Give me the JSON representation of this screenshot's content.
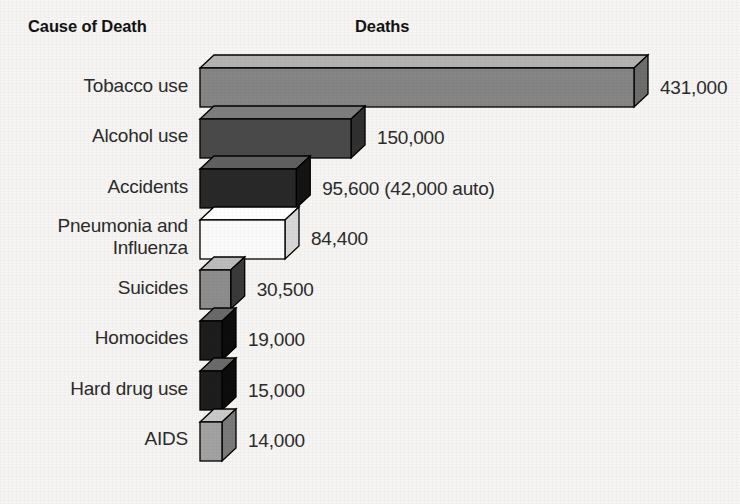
{
  "header": {
    "cause_label": "Cause of Death",
    "deaths_label": "Deaths"
  },
  "chart_data": {
    "type": "bar",
    "title": "Deaths",
    "xlabel": "Deaths",
    "ylabel": "Cause of Death",
    "orientation": "horizontal",
    "style": "3d-extruded-bars",
    "grid": false,
    "legend": false,
    "xlim": [
      0,
      431000
    ],
    "categories": [
      "Tobacco use",
      "Alcohol use",
      "Accidents",
      "Pneumonia and Influenza",
      "Suicides",
      "Homocides",
      "Hard drug use",
      "AIDS"
    ],
    "values": [
      431000,
      150000,
      95600,
      84400,
      30500,
      19000,
      15000,
      14000
    ],
    "value_labels": [
      "431,000",
      "150,000",
      "95,600 (42,000 auto)",
      "84,400",
      "30,500",
      "19,000",
      "15,000",
      "14,000"
    ],
    "annotations": [
      {
        "category": "Accidents",
        "text": "42,000 auto",
        "value": 42000
      }
    ],
    "bars": [
      {
        "label": "Tobacco use",
        "label_lines": "Tobacco use",
        "value": 431000,
        "value_label": "431,000",
        "front_color": "#858585",
        "top_color": "#b3b3b3",
        "side_color": "#6d6d6d"
      },
      {
        "label": "Alcohol use",
        "label_lines": "Alcohol use",
        "value": 150000,
        "value_label": "150,000",
        "front_color": "#4a4a4a",
        "top_color": "#7e7e7e",
        "side_color": "#303030"
      },
      {
        "label": "Accidents",
        "label_lines": "Accidents",
        "value": 95600,
        "value_label": "95,600 (42,000 auto)",
        "front_color": "#292929",
        "top_color": "#606060",
        "side_color": "#141414"
      },
      {
        "label": "Pneumonia and Influenza",
        "label_lines": "Pneumonia and\nInfluenza",
        "value": 84400,
        "value_label": "84,400",
        "front_color": "#fbfbfb",
        "top_color": "#ffffff",
        "side_color": "#d8d8d8"
      },
      {
        "label": "Suicides",
        "label_lines": "Suicides",
        "value": 30500,
        "value_label": "30,500",
        "front_color": "#8d8d8d",
        "top_color": "#bcbcbc",
        "side_color": "#3a3a3a"
      },
      {
        "label": "Homocides",
        "label_lines": "Homocides",
        "value": 19000,
        "value_label": "19,000",
        "front_color": "#1d1d1d",
        "top_color": "#6a6a6a",
        "side_color": "#0d0d0d"
      },
      {
        "label": "Hard drug use",
        "label_lines": "Hard drug use",
        "value": 15000,
        "value_label": "15,000",
        "front_color": "#1d1d1d",
        "top_color": "#6a6a6a",
        "side_color": "#0d0d0d"
      },
      {
        "label": "AIDS",
        "label_lines": "AIDS",
        "value": 14000,
        "value_label": "14,000",
        "front_color": "#a2a2a2",
        "top_color": "#c9c9c9",
        "side_color": "#7a7a7a"
      }
    ]
  },
  "colors": {
    "background": "#f6f5f3",
    "text": "#2b2b2b",
    "header_text": "#131313",
    "bar_outline": "#000000"
  }
}
